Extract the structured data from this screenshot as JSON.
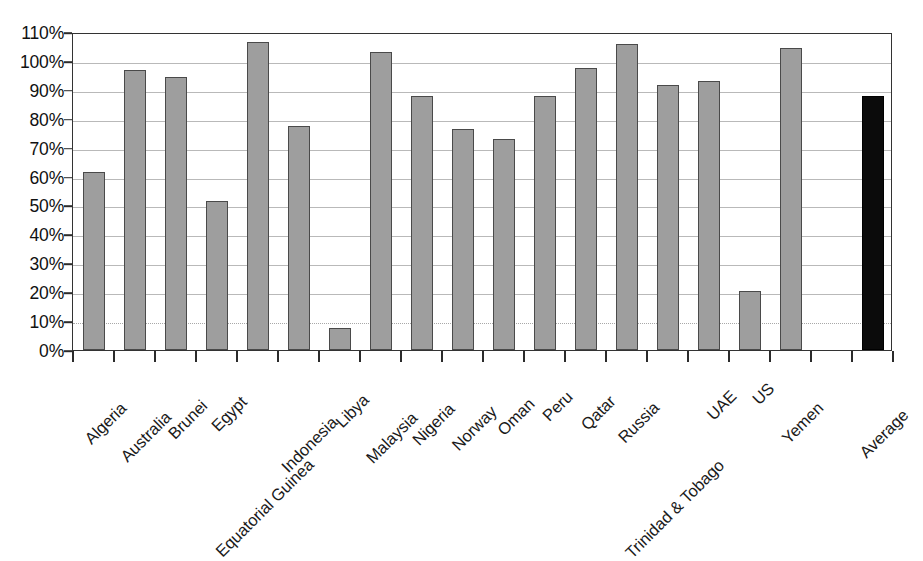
{
  "chart_data": {
    "type": "bar",
    "title": "",
    "subtitle": "",
    "xlabel": "",
    "ylabel": "",
    "ylim": [
      0,
      110
    ],
    "ytick_step": 10,
    "grid": true,
    "legend": "none",
    "value_format": "percent",
    "categories": [
      "Algeria",
      "Australia",
      "Brunei",
      "Egypt",
      "Equatorial Guinea",
      "Indonesia",
      "Libya",
      "Malaysia",
      "Nigeria",
      "Norway",
      "Oman",
      "Peru",
      "Qatar",
      "Russia",
      "Trinidad & Tobago",
      "UAE",
      "US",
      "Yemen",
      "Average"
    ],
    "values": [
      61.5,
      97,
      94.5,
      51.5,
      106.5,
      77.5,
      7.5,
      103,
      88,
      76.5,
      73,
      88,
      97.5,
      106,
      91.5,
      93,
      20.5,
      104.5,
      88
    ],
    "ytick_labels": [
      "0%",
      "10%",
      "20%",
      "30%",
      "40%",
      "50%",
      "60%",
      "70%",
      "80%",
      "90%",
      "100%",
      "110%"
    ],
    "ytick_values": [
      0,
      10,
      20,
      30,
      40,
      50,
      60,
      70,
      80,
      90,
      100,
      110
    ],
    "highlight_category": "Average",
    "colors": {
      "bar_fill": "#9e9e9e",
      "bar_stroke": "#4a4a4a",
      "highlight_fill": "#0b0b0b",
      "highlight_stroke": "#000000",
      "gridline": "#b9b9b9",
      "axis": "#333333",
      "text": "#111111",
      "background": "#ffffff"
    }
  }
}
